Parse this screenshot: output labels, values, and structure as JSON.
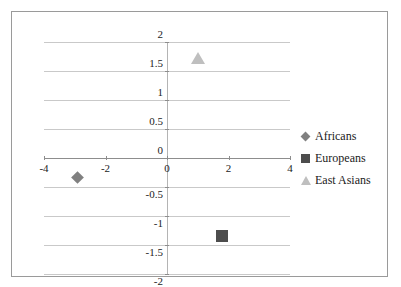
{
  "chart_data": {
    "type": "scatter",
    "title": "",
    "xlabel": "",
    "ylabel": "",
    "xlim": [
      -4,
      4
    ],
    "ylim": [
      -2,
      2
    ],
    "xticks": [
      "-4",
      "-2",
      "0",
      "2",
      "4"
    ],
    "xtick_values": [
      -4,
      -2,
      0,
      2,
      4
    ],
    "yticks": [
      "2",
      "1.5",
      "1",
      "0.5",
      "0",
      "-0.5",
      "-1",
      "-1.5",
      "-2"
    ],
    "ytick_values": [
      2,
      1.5,
      1,
      0.5,
      0,
      -0.5,
      -1,
      -1.5,
      -2
    ],
    "grid": true,
    "grid_axis": "y",
    "legend_position": "right",
    "series": [
      {
        "name": "Africans",
        "marker": "diamond",
        "color": "#808080",
        "points": [
          {
            "x": -2.9,
            "y": -0.34
          }
        ]
      },
      {
        "name": "Europeans",
        "marker": "square",
        "color": "#4d4d4d",
        "points": [
          {
            "x": 1.8,
            "y": -1.34
          }
        ]
      },
      {
        "name": "East Asians",
        "marker": "triangle",
        "color": "#bfbfbf",
        "points": [
          {
            "x": 1.0,
            "y": 1.72
          }
        ]
      }
    ]
  },
  "legend": {
    "items": [
      {
        "label": "Africans",
        "marker": "diamond",
        "color": "#808080"
      },
      {
        "label": "Europeans",
        "marker": "square",
        "color": "#4d4d4d"
      },
      {
        "label": "East Asians",
        "marker": "triangle",
        "color": "#bfbfbf"
      }
    ]
  },
  "colors": {
    "frame_border": "#9a9a9a",
    "gridline": "#c9c9c9",
    "axis_line": "#8d8d8d",
    "vertical_axis": "#b4b4b4",
    "background": "#ffffff",
    "tick_label": "#222222"
  }
}
